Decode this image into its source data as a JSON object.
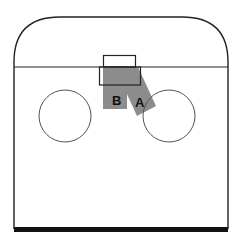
{
  "diagram": {
    "colors": {
      "line": "#222222",
      "circle": "#555555",
      "zone": "#8c8c8c",
      "floor_bar": "#111111",
      "background": "#ffffff"
    },
    "labels": {
      "zone_a": "A",
      "zone_b": "B"
    }
  }
}
